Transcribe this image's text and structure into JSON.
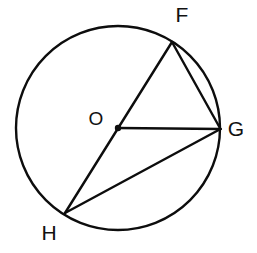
{
  "figure": {
    "type": "circle-geometry-diagram",
    "background_color": "#ffffff",
    "stroke_color": "#0d0d0d",
    "stroke_width": 2.4,
    "label_font_size": 21,
    "center_label_font_size": 19,
    "circle": {
      "cx": 118,
      "cy": 128,
      "r": 102
    },
    "center": {
      "label": "O",
      "x": 118,
      "y": 128,
      "dot_radius": 3.2,
      "label_x": 96,
      "label_y": 125
    },
    "points": [
      {
        "label": "F",
        "x": 172,
        "y": 42,
        "label_x": 182,
        "label_y": 22,
        "anchor": "middle"
      },
      {
        "label": "G",
        "x": 220.5,
        "y": 129,
        "label_x": 236,
        "label_y": 136,
        "anchor": "middle"
      },
      {
        "label": "H",
        "x": 65,
        "y": 213,
        "label_x": 49,
        "label_y": 240,
        "anchor": "middle"
      }
    ],
    "segments": [
      {
        "name": "diameter-FH",
        "from": "F",
        "to": "H"
      },
      {
        "name": "radius-OG",
        "from": "O",
        "to": "G"
      },
      {
        "name": "chord-FG",
        "from": "F",
        "to": "G"
      },
      {
        "name": "chord-HG",
        "from": "H",
        "to": "G"
      }
    ]
  }
}
